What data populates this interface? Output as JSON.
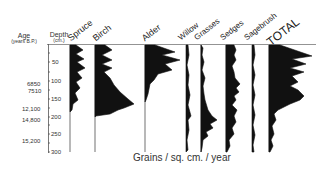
{
  "headers": {
    "age_label": "Age",
    "age_units": "(years B.P.)",
    "depth_label": "Depth",
    "depth_units": "(cm.)"
  },
  "x_axis_label": "Grains / sq. cm. / year",
  "depth_ticks": [
    {
      "label": "50",
      "y": 62
    },
    {
      "label": "100",
      "y": 81
    },
    {
      "label": "150",
      "y": 99
    },
    {
      "label": "200",
      "y": 117
    },
    {
      "label": "250",
      "y": 134
    },
    {
      "label": "300",
      "y": 152
    }
  ],
  "ages": [
    {
      "label": "6850",
      "y": 84
    },
    {
      "label": "7510",
      "y": 91
    },
    {
      "label": "12,100",
      "y": 109
    },
    {
      "label": "14,800",
      "y": 120
    },
    {
      "label": "15,200",
      "y": 141
    }
  ],
  "taxa": [
    {
      "name": "Spruce",
      "x": 70
    },
    {
      "name": "Birch",
      "x": 95
    },
    {
      "name": "Alder",
      "x": 145
    },
    {
      "name": "Willow",
      "x": 187
    },
    {
      "name": "Grasses",
      "x": 201
    },
    {
      "name": "Sedges",
      "x": 226
    },
    {
      "name": "Sagebrush",
      "x": 253
    },
    {
      "name": "TOTAL",
      "x": 269
    }
  ],
  "colors": {
    "ink": "#111111",
    "axis": "#555555",
    "background": "#ffffff"
  }
}
